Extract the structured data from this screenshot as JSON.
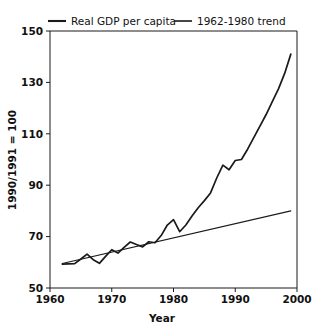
{
  "chart_data": {
    "type": "line",
    "title": "",
    "xlabel": "Year",
    "ylabel": "1990/1991 = 100",
    "xlim": [
      1960,
      2000
    ],
    "ylim": [
      50,
      150
    ],
    "xticks": [
      1960,
      1970,
      1980,
      1990,
      2000
    ],
    "xticklabels": [
      "1960",
      "1970",
      "1980",
      "1990",
      "2000"
    ],
    "yticks": [
      50,
      70,
      90,
      110,
      130,
      150
    ],
    "yticklabels": [
      "50",
      "70",
      "90",
      "110",
      "130",
      "150"
    ],
    "grid": false,
    "legend_position": "above-plot",
    "series": [
      {
        "name": "Real GDP per capita",
        "x": [
          1962,
          1963,
          1964,
          1965,
          1966,
          1967,
          1968,
          1969,
          1970,
          1971,
          1972,
          1973,
          1974,
          1975,
          1976,
          1977,
          1978,
          1979,
          1980,
          1981,
          1982,
          1983,
          1984,
          1985,
          1986,
          1987,
          1988,
          1989,
          1990,
          1991,
          1992,
          1993,
          1994,
          1995,
          1996,
          1997,
          1998,
          1999
        ],
        "values": [
          59.3,
          59.4,
          59.5,
          61.3,
          63.2,
          61.0,
          59.6,
          62.3,
          64.9,
          63.6,
          65.8,
          67.9,
          66.9,
          66.0,
          68.0,
          67.6,
          70.4,
          74.5,
          76.6,
          71.9,
          74.5,
          78.0,
          81.2,
          84.0,
          87.0,
          92.8,
          97.8,
          96.0,
          99.6,
          100.0,
          104.0,
          108.5,
          113.0,
          117.5,
          122.5,
          127.5,
          133.5,
          141.0
        ]
      },
      {
        "name": "1962-1980 trend",
        "x": [
          1962,
          1999
        ],
        "values": [
          59.5,
          80.0
        ]
      }
    ],
    "legend": [
      {
        "label": "Real GDP per capita",
        "style": "thick-line",
        "color": "#1a1a1a"
      },
      {
        "label": "1962-1980 trend",
        "style": "thin-line",
        "color": "#1a1a1a"
      }
    ]
  },
  "colors": {
    "axis": "#1a1a1a",
    "series_main": "#1a1a1a",
    "series_trend": "#1a1a1a",
    "background": "#ffffff"
  }
}
